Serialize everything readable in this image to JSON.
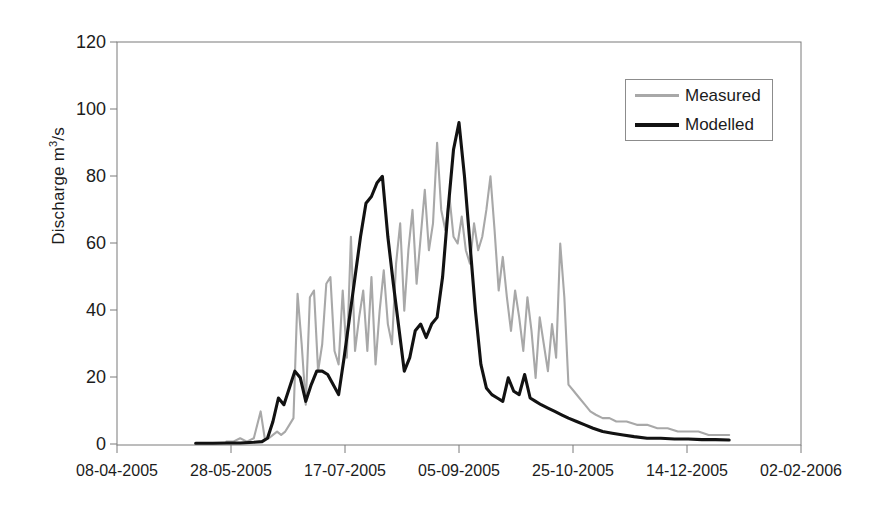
{
  "chart_data": {
    "type": "line",
    "title": "",
    "xlabel": "",
    "ylabel": "Discharge m3/s",
    "ylabel_prefix": "Discharge m",
    "ylabel_sup": "3",
    "ylabel_suffix": "/s",
    "ylim": [
      0,
      120
    ],
    "yticks": [
      120,
      100,
      80,
      60,
      40,
      20,
      0
    ],
    "xticks": [
      "08-04-2005",
      "28-05-2005",
      "17-07-2005",
      "05-09-2005",
      "25-10-2005",
      "14-12-2005",
      "02-02-2006"
    ],
    "grid": false,
    "legend_position": "top-right",
    "colors": {
      "measured": "#a8a8a8",
      "modelled": "#121212",
      "axis": "#6e6e6e"
    },
    "series": [
      {
        "name": "Measured",
        "color": "#a8a8a8",
        "x": [
          0.16,
          0.17,
          0.18,
          0.19,
          0.2,
          0.21,
          0.216,
          0.222,
          0.228,
          0.234,
          0.24,
          0.246,
          0.252,
          0.258,
          0.264,
          0.27,
          0.276,
          0.282,
          0.288,
          0.294,
          0.3,
          0.306,
          0.312,
          0.318,
          0.324,
          0.33,
          0.336,
          0.342,
          0.348,
          0.354,
          0.36,
          0.366,
          0.372,
          0.378,
          0.384,
          0.39,
          0.396,
          0.402,
          0.408,
          0.414,
          0.42,
          0.426,
          0.432,
          0.438,
          0.444,
          0.45,
          0.456,
          0.462,
          0.468,
          0.474,
          0.48,
          0.486,
          0.492,
          0.498,
          0.504,
          0.51,
          0.516,
          0.522,
          0.528,
          0.534,
          0.54,
          0.546,
          0.552,
          0.558,
          0.564,
          0.57,
          0.576,
          0.582,
          0.588,
          0.594,
          0.6,
          0.606,
          0.612,
          0.618,
          0.624,
          0.63,
          0.636,
          0.642,
          0.648,
          0.654,
          0.66,
          0.668,
          0.676,
          0.684,
          0.692,
          0.7,
          0.71,
          0.72,
          0.73,
          0.745,
          0.76,
          0.775,
          0.79,
          0.805,
          0.82,
          0.835,
          0.85,
          0.865,
          0.88,
          0.895
        ],
        "values": [
          1,
          1,
          2,
          1,
          2,
          10,
          2,
          2,
          3,
          4,
          3,
          4,
          6,
          8,
          45,
          30,
          12,
          44,
          46,
          22,
          30,
          48,
          50,
          28,
          24,
          46,
          26,
          62,
          28,
          38,
          46,
          28,
          50,
          24,
          40,
          52,
          36,
          30,
          54,
          66,
          40,
          58,
          70,
          48,
          62,
          76,
          58,
          66,
          90,
          70,
          64,
          74,
          62,
          60,
          68,
          58,
          54,
          66,
          58,
          62,
          70,
          80,
          64,
          46,
          56,
          44,
          34,
          46,
          38,
          28,
          44,
          34,
          20,
          38,
          30,
          22,
          36,
          26,
          60,
          44,
          18,
          16,
          14,
          12,
          10,
          9,
          8,
          8,
          7,
          7,
          6,
          6,
          5,
          5,
          4,
          4,
          4,
          3,
          3,
          3
        ]
      },
      {
        "name": "Modelled",
        "color": "#121212",
        "x": [
          0.115,
          0.14,
          0.16,
          0.18,
          0.2,
          0.212,
          0.22,
          0.228,
          0.236,
          0.244,
          0.252,
          0.26,
          0.268,
          0.276,
          0.284,
          0.292,
          0.3,
          0.308,
          0.316,
          0.324,
          0.332,
          0.34,
          0.348,
          0.356,
          0.364,
          0.372,
          0.38,
          0.388,
          0.396,
          0.404,
          0.412,
          0.42,
          0.428,
          0.436,
          0.444,
          0.452,
          0.46,
          0.468,
          0.476,
          0.484,
          0.492,
          0.5,
          0.508,
          0.516,
          0.524,
          0.532,
          0.54,
          0.548,
          0.556,
          0.564,
          0.572,
          0.58,
          0.588,
          0.596,
          0.604,
          0.612,
          0.62,
          0.63,
          0.64,
          0.65,
          0.66,
          0.672,
          0.684,
          0.696,
          0.71,
          0.724,
          0.74,
          0.756,
          0.775,
          0.795,
          0.815,
          0.835,
          0.855,
          0.875,
          0.895
        ],
        "values": [
          0.5,
          0.5,
          0.6,
          0.6,
          0.8,
          1,
          2,
          7,
          14,
          12,
          17,
          22,
          20,
          13,
          18,
          22,
          22,
          21,
          18,
          15,
          26,
          38,
          50,
          62,
          72,
          74,
          78,
          80,
          62,
          48,
          35,
          22,
          26,
          34,
          36,
          32,
          36,
          38,
          50,
          70,
          88,
          96,
          80,
          60,
          40,
          24,
          17,
          15,
          14,
          13,
          20,
          16,
          15,
          21,
          14,
          13,
          12,
          11,
          10,
          9,
          8,
          7,
          6,
          5,
          4,
          3.5,
          3,
          2.5,
          2,
          2,
          1.8,
          1.8,
          1.6,
          1.6,
          1.5
        ]
      }
    ]
  },
  "legend": {
    "items": [
      {
        "label": "Measured"
      },
      {
        "label": "Modelled"
      }
    ]
  }
}
